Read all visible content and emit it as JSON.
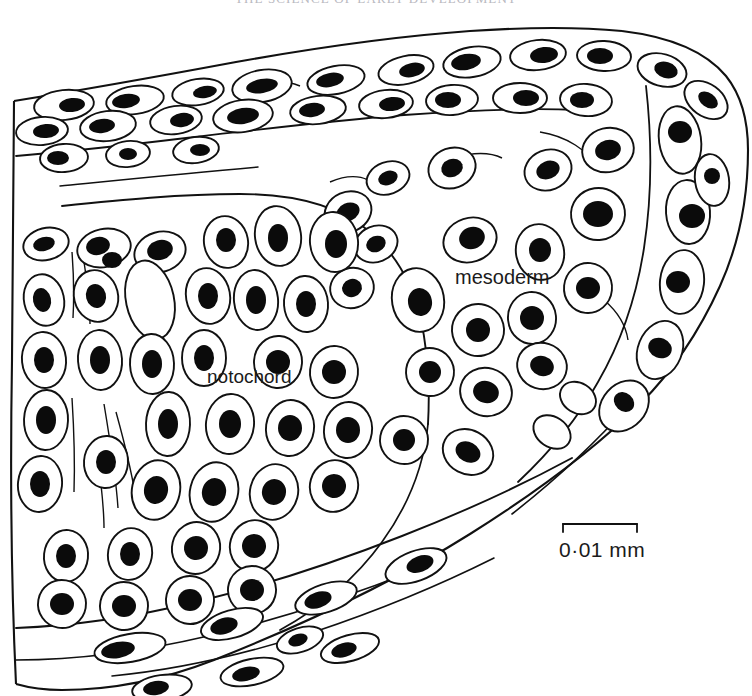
{
  "page": {
    "running_head": "THE SCIENCE OF EARLY DEVELOPMENT",
    "width": 752,
    "height": 696,
    "background_color": "#ffffff",
    "ink_color": "#111111"
  },
  "figure": {
    "kind": "histological-section-line-drawing",
    "regions": [
      {
        "name": "ectoderm-dorsal-layer",
        "position": "top band"
      },
      {
        "name": "notochord",
        "position": "left-centre"
      },
      {
        "name": "mesoderm",
        "position": "right and centre"
      },
      {
        "name": "ventral-endoderm-layer",
        "position": "bottom band"
      }
    ]
  },
  "labels": {
    "mesoderm": "mesoderm",
    "notochord": "notochord"
  },
  "scale_bar": {
    "text": "0·01 mm",
    "value": "0.01",
    "unit": "mm",
    "x_start": 563,
    "x_end": 637,
    "y": 524
  }
}
